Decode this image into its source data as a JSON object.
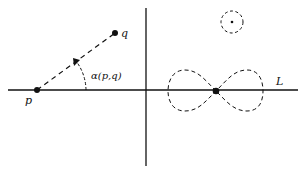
{
  "diagram": {
    "points": {
      "p": {
        "label": "p",
        "x": 37,
        "y": 90
      },
      "q": {
        "label": "q",
        "x": 115,
        "y": 33
      }
    },
    "angle_label": "α(p,q)",
    "line_label": "L",
    "colors": {
      "ink": "#111111",
      "background": "#ffffff"
    }
  }
}
